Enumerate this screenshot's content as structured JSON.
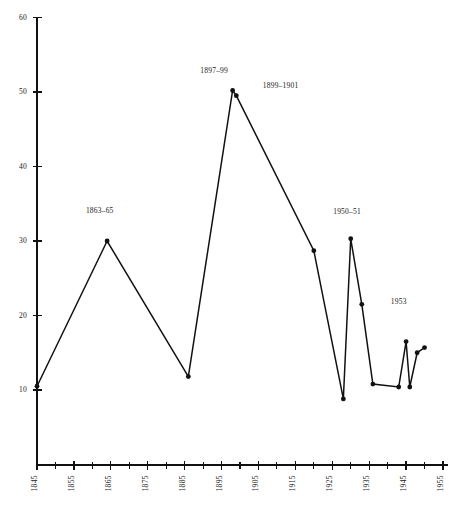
{
  "chart_data": {
    "type": "line",
    "title": "",
    "subtitle": "",
    "xlabel": "",
    "ylabel": "",
    "xlim": [
      1845,
      1955
    ],
    "ylim": [
      0,
      60
    ],
    "grid": false,
    "legend": "none",
    "y_ticks": [
      10,
      20,
      30,
      40,
      50,
      60
    ],
    "y_tick_labels": [
      "10",
      "20",
      "30",
      "40",
      "50",
      "60"
    ],
    "x_ticks": [
      1845,
      1855,
      1865,
      1875,
      1885,
      1895,
      1905,
      1915,
      1925,
      1935,
      1945,
      1955
    ],
    "x_tick_labels": [
      "1845",
      "1855",
      "1865",
      "1875",
      "1885",
      "1895",
      "1905",
      "1915",
      "1925",
      "1935",
      "1945",
      "1955"
    ],
    "x_minor_ticks": [
      1850,
      1860,
      1870,
      1880,
      1890,
      1900,
      1910,
      1920,
      1930,
      1940,
      1950
    ],
    "x": [
      1845,
      1864,
      1886,
      1898,
      1899,
      1920,
      1928,
      1930,
      1933,
      1936,
      1943,
      1945,
      1946,
      1948,
      1950
    ],
    "values": [
      10.5,
      30.0,
      11.8,
      50.2,
      49.5,
      28.7,
      8.8,
      30.3,
      21.5,
      10.8,
      10.4,
      16.5,
      10.4,
      15.0,
      15.7
    ],
    "series": [
      {
        "name": "series-1",
        "values": [
          10.5,
          30.0,
          11.8,
          50.2,
          49.5,
          28.7,
          8.8,
          30.3,
          21.5,
          10.8,
          10.4,
          16.5,
          10.4,
          15.0,
          15.7
        ]
      }
    ],
    "annotations": [
      {
        "text": "1863–65",
        "x": 1862,
        "y": 33.8
      },
      {
        "text": "1897–99",
        "x": 1893,
        "y": 52.6
      },
      {
        "text": "1899–1901",
        "x": 1911,
        "y": 50.6
      },
      {
        "text": "1950–51",
        "x": 1929,
        "y": 33.6
      },
      {
        "text": "1953",
        "x": 1943,
        "y": 21.6
      }
    ]
  },
  "colors": {
    "line": "#111111",
    "marker": "#111111",
    "axis": "#111111",
    "text": "#1a1a1a",
    "background": "#ffffff"
  }
}
